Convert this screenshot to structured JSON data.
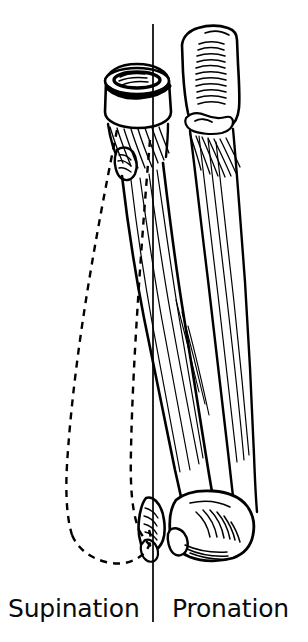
{
  "figure": {
    "background_color": "#ffffff",
    "ink_color": "#000000",
    "width": 308,
    "height": 642
  },
  "captions": {
    "left_label": "Supination",
    "right_label": "Pronation"
  },
  "axis": {
    "name": "longitudinal-rotation-axis",
    "description": "vertical reference line through radial head and ulnar styloid",
    "x": 153,
    "y_top": 24,
    "y_bottom": 622,
    "stroke_width": 1.6,
    "color": "#000000"
  },
  "bones": [
    {
      "id": "radius-pronated",
      "label": "Radius (pronated position)",
      "line_style": "solid",
      "position": "crosses obliquely over the ulna",
      "color": "#000000"
    },
    {
      "id": "ulna",
      "label": "Ulna",
      "line_style": "solid",
      "position": "right, runs nearly vertical from olecranon to styloid",
      "color": "#000000"
    },
    {
      "id": "radius-supinated",
      "label": "Radius (supinated position)",
      "line_style": "dashed",
      "position": "left, bowed laterally and parallel to the ulna",
      "color": "#000000",
      "dash_pattern": "7,6"
    }
  ],
  "landmarks": [
    {
      "id": "radial-head",
      "label": "Head of radius"
    },
    {
      "id": "radial-fovea",
      "label": "Fovea of radial head"
    },
    {
      "id": "radial-neck",
      "label": "Neck of radius"
    },
    {
      "id": "radial-tuberosity",
      "label": "Radial tuberosity"
    },
    {
      "id": "olecranon",
      "label": "Olecranon of ulna"
    },
    {
      "id": "trochlear-notch",
      "label": "Trochlear notch"
    },
    {
      "id": "coronoid-process",
      "label": "Coronoid process"
    },
    {
      "id": "interosseous-border",
      "label": "Interosseous border"
    },
    {
      "id": "ulnar-head",
      "label": "Head of ulna"
    },
    {
      "id": "ulnar-styloid",
      "label": "Styloid process of ulna"
    },
    {
      "id": "distal-radius",
      "label": "Distal end of radius"
    },
    {
      "id": "radial-styloid",
      "label": "Styloid process of radius"
    }
  ]
}
